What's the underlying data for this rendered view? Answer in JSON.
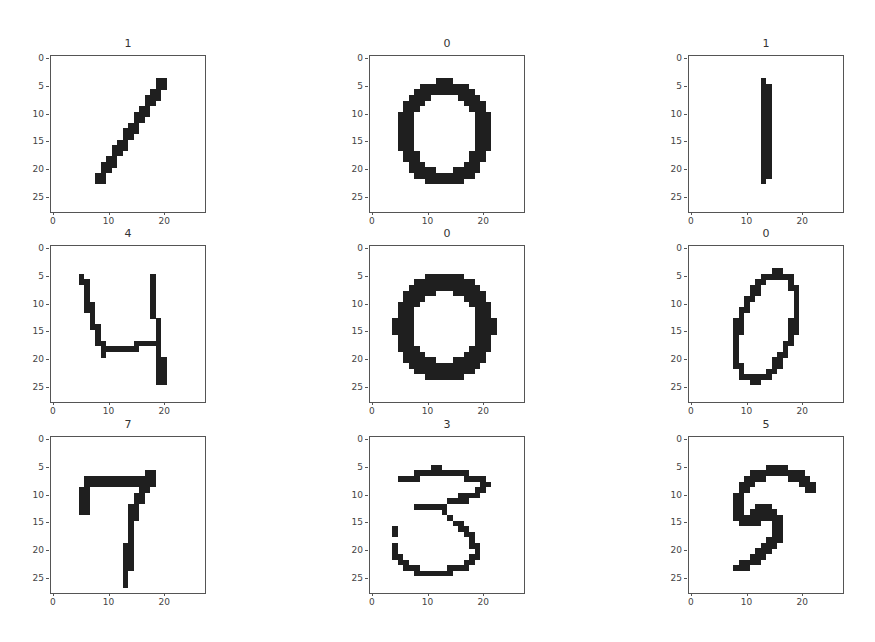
{
  "chart_data": {
    "type": "heatmap",
    "title": "",
    "grid": {
      "rows": 3,
      "cols": 3
    },
    "xlim": [
      -0.5,
      27.5
    ],
    "ylim": [
      27.5,
      -0.5
    ],
    "xticks": [
      0,
      10,
      20
    ],
    "yticks": [
      0,
      5,
      10,
      15,
      20,
      25
    ],
    "colormap": "binary",
    "ink_color": "#1f1f1f",
    "panels": [
      {
        "title": "1",
        "label": 1,
        "row": 0,
        "col": 0,
        "strokes": [
          [
            [
              20.5,
              4.5
            ],
            [
              8.5,
              22.5
            ]
          ]
        ],
        "width": 1.8
      },
      {
        "title": "0",
        "label": 0,
        "row": 0,
        "col": 1,
        "ellipse": {
          "cx": 13.5,
          "cy": 13.8,
          "rx": 7.2,
          "ry": 8.2,
          "rot": 0
        },
        "width": 2.6
      },
      {
        "title": "1",
        "label": 1,
        "row": 0,
        "col": 2,
        "strokes": [
          [
            [
              13.5,
              5
            ],
            [
              14,
              12
            ],
            [
              14.3,
              18
            ],
            [
              13.5,
              22.5
            ]
          ]
        ],
        "width": 1.8
      },
      {
        "title": "4",
        "label": 4,
        "row": 1,
        "col": 0,
        "strokes": [
          [
            [
              5,
              5
            ],
            [
              6.5,
              7
            ],
            [
              7.3,
              13
            ],
            [
              8.5,
              16
            ],
            [
              9.5,
              19
            ],
            [
              12,
              18.5
            ],
            [
              16,
              18
            ],
            [
              19,
              17
            ]
          ],
          [
            [
              18.5,
              6
            ],
            [
              18.5,
              12
            ],
            [
              19.5,
              14
            ],
            [
              19.8,
              17
            ],
            [
              20,
              25
            ]
          ]
        ],
        "width": 1
      },
      {
        "title": "0",
        "label": 0,
        "row": 1,
        "col": 1,
        "ellipse": {
          "cx": 13.5,
          "cy": 14.5,
          "rx": 7.5,
          "ry": 8,
          "rot": 0
        },
        "width": 3.2
      },
      {
        "title": "0",
        "label": 0,
        "row": 1,
        "col": 2,
        "ellipse": {
          "cx": 14,
          "cy": 14.5,
          "rx": 4.8,
          "ry": 9.8,
          "rot": 18
        },
        "width": 1.3
      },
      {
        "title": "7",
        "label": 7,
        "row": 2,
        "col": 0,
        "strokes": [
          [
            [
              7,
              8
            ],
            [
              18.5,
              8
            ]
          ],
          [
            [
              6,
              10
            ],
            [
              6,
              13.5
            ]
          ],
          [
            [
              18,
              7
            ],
            [
              16.5,
              10
            ],
            [
              15,
              13
            ],
            [
              14.5,
              17
            ],
            [
              14,
              21
            ],
            [
              13.5,
              26
            ]
          ]
        ],
        "width": 1.3
      },
      {
        "title": "3",
        "label": 3,
        "row": 2,
        "col": 1,
        "strokes": [
          [
            [
              5,
              8
            ],
            [
              8,
              7
            ],
            [
              12,
              6
            ],
            [
              18,
              7
            ],
            [
              21.5,
              8.5
            ],
            [
              19,
              10.5
            ],
            [
              15,
              11.5
            ],
            [
              13,
              12.5
            ],
            [
              9,
              12.5
            ]
          ],
          [
            [
              13,
              13
            ],
            [
              15,
              15
            ],
            [
              18,
              17.5
            ],
            [
              19.5,
              20
            ],
            [
              18.5,
              22.5
            ],
            [
              15,
              24
            ],
            [
              11,
              24.8
            ],
            [
              8,
              24
            ],
            [
              5.5,
              22.5
            ],
            [
              4.5,
              20
            ]
          ],
          [
            [
              4.5,
              17
            ],
            [
              4.5,
              17.6
            ]
          ]
        ],
        "width": 1
      },
      {
        "title": "5",
        "label": 5,
        "row": 2,
        "col": 2,
        "strokes": [
          [
            [
              22.5,
              9
            ],
            [
              20,
              7
            ],
            [
              16,
              6
            ],
            [
              12,
              7
            ],
            [
              10.5,
              8.5
            ],
            [
              9,
              11
            ],
            [
              8.5,
              14
            ],
            [
              9.5,
              15
            ],
            [
              12,
              15
            ],
            [
              12.5,
              13.5
            ],
            [
              15,
              13.5
            ],
            [
              16,
              15.5
            ],
            [
              15.5,
              19
            ],
            [
              13,
              21
            ],
            [
              11,
              22.5
            ],
            [
              9,
              23.5
            ]
          ]
        ],
        "width": 1.9
      }
    ]
  },
  "panels": [
    {
      "title": "1"
    },
    {
      "title": "0"
    },
    {
      "title": "1"
    },
    {
      "title": "4"
    },
    {
      "title": "0"
    },
    {
      "title": "0"
    },
    {
      "title": "7"
    },
    {
      "title": "3"
    },
    {
      "title": "5"
    }
  ],
  "axis": {
    "yticks": [
      "0",
      "5",
      "10",
      "15",
      "20",
      "25"
    ],
    "xticks": [
      "0",
      "10",
      "20"
    ]
  }
}
